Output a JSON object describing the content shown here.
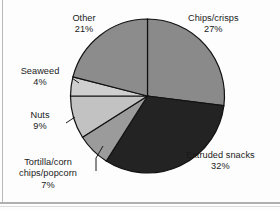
{
  "chart_data": {
    "type": "pie",
    "title": "",
    "subtitle": "",
    "xlabel": "",
    "ylabel": "",
    "legend_position": "labels-with-leader-lines",
    "grid": false,
    "start_angle_deg": 0,
    "direction": "clockwise",
    "categories": [
      "Chips/crisps",
      "Extruded snacks",
      "Tortilla/corn chips/popcorn",
      "Nuts",
      "Seaweed",
      "Other"
    ],
    "values": [
      27,
      32,
      7,
      9,
      4,
      21
    ],
    "value_unit": "%",
    "total": 100,
    "slices": [
      {
        "label": "Chips/crisps",
        "label_line1": "Chips/crisps",
        "label_line2": "27%",
        "value": 27,
        "percent_text": "27%",
        "color": "#8a8a8a",
        "has_leader_line": false
      },
      {
        "label": "Extruded snacks",
        "label_line1": "Extruded snacks",
        "label_line2": "32%",
        "value": 32,
        "percent_text": "32%",
        "color": "#232323",
        "has_leader_line": false
      },
      {
        "label": "Tortilla/corn chips/popcorn",
        "label_line1": "Tortilla/corn",
        "label_line2": "chips/popcorn",
        "label_line3": "7%",
        "value": 7,
        "percent_text": "7%",
        "color": "#9b9b9b",
        "has_leader_line": true
      },
      {
        "label": "Nuts",
        "label_line1": "Nuts",
        "label_line2": "9%",
        "value": 9,
        "percent_text": "9%",
        "color": "#c2c2c2",
        "has_leader_line": true
      },
      {
        "label": "Seaweed",
        "label_line1": "Seaweed",
        "label_line2": "4%",
        "value": 4,
        "percent_text": "4%",
        "color": "#cfcfcf",
        "has_leader_line": true
      },
      {
        "label": "Other",
        "label_line1": "Other",
        "label_line2": "21%",
        "value": 21,
        "percent_text": "21%",
        "color": "#8c8c8c",
        "has_leader_line": false
      }
    ],
    "colors": {
      "chips": "#8a8a8a",
      "extruded": "#232323",
      "tortilla": "#9b9b9b",
      "nuts": "#c2c2c2",
      "seaweed": "#cfcfcf",
      "other": "#8c8c8c",
      "outline": "#111111",
      "background": "#fdfdfd",
      "text": "#1a1a1a",
      "frame": "#b0b0b0"
    }
  }
}
